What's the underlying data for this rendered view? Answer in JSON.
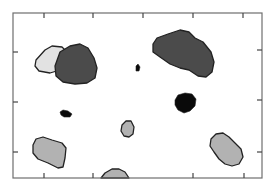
{
  "figure": {
    "frame": {
      "x1": 13,
      "y1": 13,
      "x2": 262,
      "y2": 178,
      "color": "#6e6e6e"
    },
    "ticks": {
      "top_x": [
        44,
        93,
        143,
        193,
        243
      ],
      "bottom_x": [
        44,
        93,
        193,
        244
      ],
      "left_y": [
        52,
        102,
        152
      ],
      "right_y": [
        50,
        100,
        152
      ],
      "length": 5,
      "color": "#444444"
    },
    "colors": {
      "light": "#e2e2e2",
      "dark": "#4b4b4b",
      "black": "#0a0a0a",
      "gray": "#b2b2b2",
      "outline": "#222222"
    },
    "blobs": [
      {
        "name": "light-blob-top-left",
        "fill": "light",
        "d": "M36,60 L45,50 L52,46 L62,47 L67,52 L66,62 L60,70 L50,73 L39,71 L35,66 Z"
      },
      {
        "name": "dark-blob-top-left",
        "fill": "dark",
        "d": "M60,52 L70,46 L80,44 L88,48 L94,58 L97,68 L95,78 L87,83 L75,84 L63,82 L56,76 L55,66 Z"
      },
      {
        "name": "dark-blob-top-right",
        "fill": "dark",
        "d": "M153,44 L157,38 L168,34 L180,30 L189,32 L195,38 L203,42 L211,52 L214,62 L212,72 L206,77 L198,76 L189,70 L180,68 L170,64 L160,57 L153,52 Z"
      },
      {
        "name": "black-dot-center",
        "fill": "black",
        "d": "M136,66 L138,64 L140,67 L139,71 L136,71 Z"
      },
      {
        "name": "black-blob-left",
        "fill": "black",
        "d": "M60,112 L63,110 L68,111 L72,114 L70,117 L64,117 L61,115 Z"
      },
      {
        "name": "black-blob-right",
        "fill": "black",
        "d": "M175,100 L178,95 L185,93 L192,94 L196,99 L195,106 L190,111 L184,113 L178,110 L175,105 Z"
      },
      {
        "name": "gray-blob-bottom-left",
        "fill": "gray",
        "d": "M33,145 L36,139 L43,137 L52,140 L62,143 L66,148 L65,158 L63,167 L58,168 L48,163 L38,159 L33,153 Z"
      },
      {
        "name": "gray-blob-center-small",
        "fill": "gray",
        "d": "M122,125 L126,121 L131,121 L134,127 L133,134 L129,137 L124,136 L121,131 Z"
      },
      {
        "name": "gray-blob-bottom-center",
        "fill": "gray",
        "d": "M101,178 L105,173 L112,169 L119,169 L125,172 L129,178 Z"
      },
      {
        "name": "gray-blob-right",
        "fill": "gray",
        "d": "M211,139 L216,134 L223,133 L229,137 L235,143 L241,149 L243,157 L239,164 L232,166 L225,164 L219,159 L214,152 L210,146 Z"
      }
    ]
  }
}
